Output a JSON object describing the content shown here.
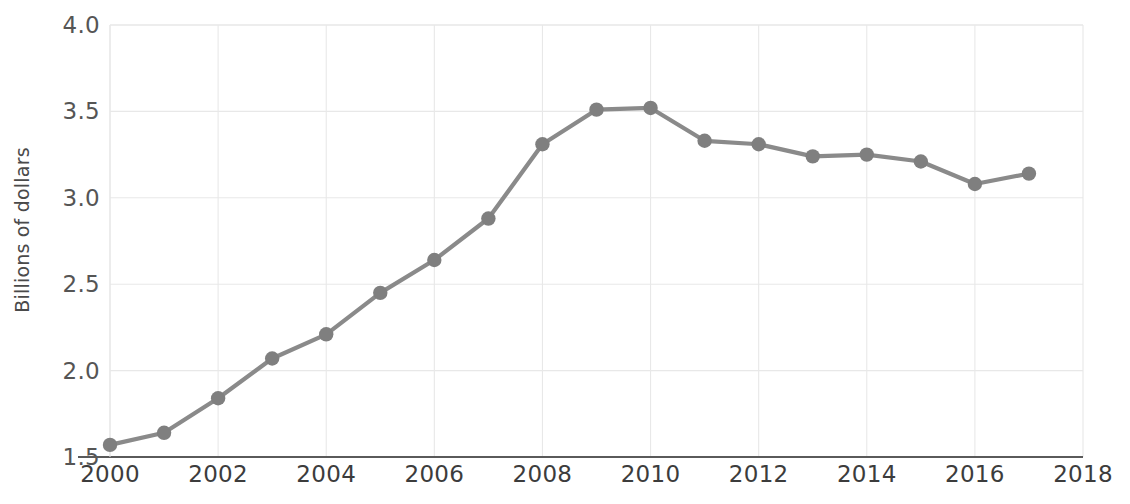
{
  "chart_data": {
    "type": "line",
    "title": "",
    "xlabel": "",
    "ylabel": "Billions of dollars",
    "x": [
      2000,
      2001,
      2002,
      2003,
      2004,
      2005,
      2006,
      2007,
      2008,
      2009,
      2010,
      2011,
      2012,
      2013,
      2014,
      2015,
      2016,
      2017
    ],
    "values": [
      1.57,
      1.64,
      1.84,
      2.07,
      2.21,
      2.45,
      2.64,
      2.88,
      3.31,
      3.51,
      3.52,
      3.33,
      3.31,
      3.24,
      3.25,
      3.21,
      3.08,
      3.14
    ],
    "series": [
      {
        "name": "Billions of dollars",
        "values": [
          1.57,
          1.64,
          1.84,
          2.07,
          2.21,
          2.45,
          2.64,
          2.88,
          3.31,
          3.51,
          3.52,
          3.33,
          3.31,
          3.24,
          3.25,
          3.21,
          3.08,
          3.14
        ]
      }
    ],
    "xlim": [
      2000,
      2018
    ],
    "ylim": [
      1.5,
      4.0
    ],
    "xticks": [
      2000,
      2002,
      2004,
      2006,
      2008,
      2010,
      2012,
      2014,
      2016,
      2018
    ],
    "xticklabels": [
      "2000",
      "2002",
      "2004",
      "2006",
      "2008",
      "2010",
      "2012",
      "2014",
      "2016",
      "2018"
    ],
    "yticks": [
      1.5,
      2.0,
      2.5,
      3.0,
      3.5,
      4.0
    ],
    "yticklabels": [
      "1.5",
      "2.0",
      "2.5",
      "3.0",
      "3.5",
      "4.0"
    ],
    "grid": true,
    "legend": "none",
    "line_color": "#8a8a8a",
    "marker_color": "#7f7f7f",
    "grid_color": "#e8e8e8",
    "axis_color": "#5a5a5a",
    "background_color": "#ffffff"
  }
}
